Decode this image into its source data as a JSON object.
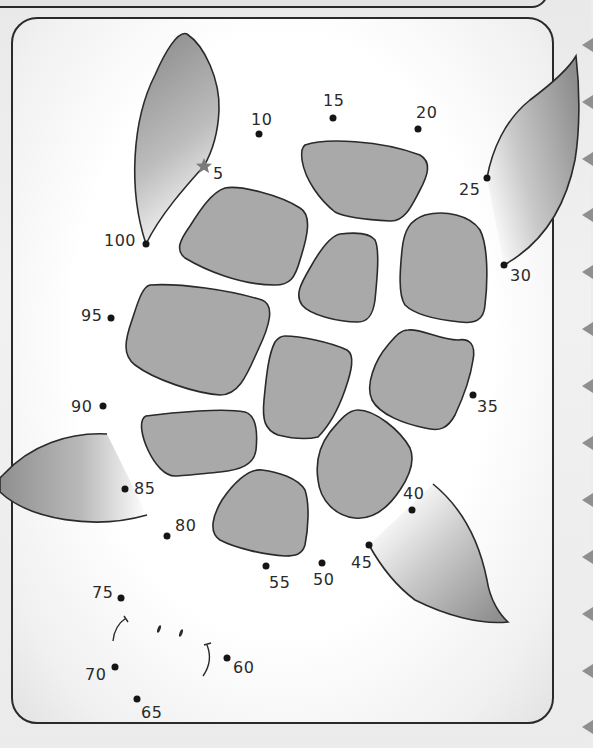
{
  "worksheet": {
    "type": "connect-the-dots",
    "subject": "sea turtle",
    "count_by": 5,
    "start_marker": "star-icon",
    "start_number": "5",
    "end_number": "100",
    "colors": {
      "shell_fill": "#a9a9a9",
      "outline": "#2a2a2a",
      "dot": "#151515",
      "frame_border": "#2a2a2a"
    }
  },
  "dots": [
    {
      "n": "5",
      "x": 204,
      "y": 166,
      "lx": 213,
      "ly": 166,
      "star": true
    },
    {
      "n": "10",
      "x": 259,
      "y": 134,
      "lx": 251,
      "ly": 112
    },
    {
      "n": "15",
      "x": 333,
      "y": 118,
      "lx": 323,
      "ly": 93
    },
    {
      "n": "20",
      "x": 418,
      "y": 129,
      "lx": 416,
      "ly": 105
    },
    {
      "n": "25",
      "x": 487,
      "y": 178,
      "lx": 459,
      "ly": 182
    },
    {
      "n": "30",
      "x": 504,
      "y": 265,
      "lx": 510,
      "ly": 268
    },
    {
      "n": "35",
      "x": 473,
      "y": 395,
      "lx": 477,
      "ly": 399
    },
    {
      "n": "40",
      "x": 412,
      "y": 510,
      "lx": 403,
      "ly": 486
    },
    {
      "n": "45",
      "x": 369,
      "y": 545,
      "lx": 351,
      "ly": 555
    },
    {
      "n": "50",
      "x": 322,
      "y": 563,
      "lx": 313,
      "ly": 572
    },
    {
      "n": "55",
      "x": 266,
      "y": 566,
      "lx": 269,
      "ly": 575
    },
    {
      "n": "60",
      "x": 227,
      "y": 658,
      "lx": 233,
      "ly": 660
    },
    {
      "n": "65",
      "x": 137,
      "y": 699,
      "lx": 141,
      "ly": 705
    },
    {
      "n": "70",
      "x": 115,
      "y": 667,
      "lx": 85,
      "ly": 667
    },
    {
      "n": "75",
      "x": 121,
      "y": 598,
      "lx": 92,
      "ly": 585
    },
    {
      "n": "80",
      "x": 167,
      "y": 536,
      "lx": 175,
      "ly": 518
    },
    {
      "n": "85",
      "x": 125,
      "y": 489,
      "lx": 134,
      "ly": 481
    },
    {
      "n": "90",
      "x": 103,
      "y": 406,
      "lx": 71,
      "ly": 399
    },
    {
      "n": "95",
      "x": 111,
      "y": 318,
      "lx": 81,
      "ly": 308
    },
    {
      "n": "100",
      "x": 146,
      "y": 244,
      "lx": 104,
      "ly": 233
    }
  ],
  "side_tabs": [
    38,
    95,
    152,
    208,
    265,
    322,
    379,
    436,
    493,
    550,
    607,
    664,
    720
  ]
}
